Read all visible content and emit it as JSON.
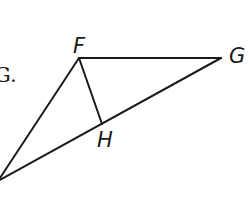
{
  "caption_fragment": "G.",
  "diagram": {
    "type": "geometry",
    "stroke_color": "#1a1a1a",
    "background": "#ffffff",
    "points": [
      {
        "name": "F",
        "label": "F",
        "x": 79,
        "y": 58
      },
      {
        "name": "G",
        "label": "G",
        "x": 221,
        "y": 58
      },
      {
        "name": "H",
        "label": "H",
        "x": 102,
        "y": 124
      },
      {
        "name": "E",
        "label": "",
        "x": -2,
        "y": 181
      }
    ],
    "segments": [
      [
        "F",
        "G"
      ],
      [
        "F",
        "H"
      ],
      [
        "E",
        "F"
      ],
      [
        "E",
        "G"
      ]
    ],
    "labels": {
      "F": "F",
      "G": "G",
      "H": "H"
    }
  }
}
